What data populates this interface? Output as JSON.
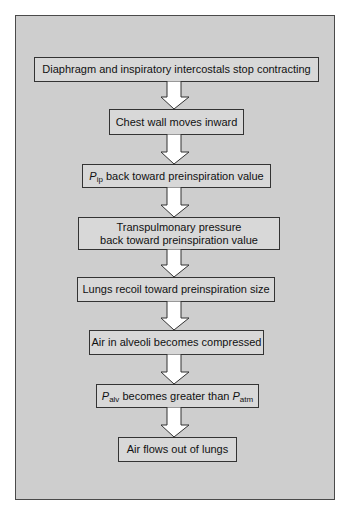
{
  "diagram": {
    "type": "flowchart",
    "direction": "top-to-bottom",
    "colors": {
      "panel_background": "#cecece",
      "box_fill": "#d8d8d8",
      "box_border": "#333333",
      "arrow_fill": "#ffffff",
      "arrow_stroke": "#333333"
    },
    "steps": [
      {
        "text": "Diaphragm and inspiratory intercostals stop contracting"
      },
      {
        "text": "Chest wall moves inward"
      },
      {
        "sym": "P",
        "sub": "ip",
        "text": " back toward preinspiration value"
      },
      {
        "line1": "Transpulmonary pressure",
        "line2": "back toward preinspiration value"
      },
      {
        "text": "Lungs recoil toward preinspiration size"
      },
      {
        "text": "Air in alveoli becomes compressed"
      },
      {
        "sym": "P",
        "sub": "alv",
        "text": " becomes greater than ",
        "sym2": "P",
        "sub2": "atm"
      },
      {
        "text": "Air flows out of lungs"
      }
    ],
    "arrows": [
      {
        "from": 0,
        "to": 1,
        "icon": "down-arrow-icon"
      },
      {
        "from": 1,
        "to": 2,
        "icon": "down-arrow-icon"
      },
      {
        "from": 2,
        "to": 3,
        "icon": "down-arrow-icon"
      },
      {
        "from": 3,
        "to": 4,
        "icon": "down-arrow-icon"
      },
      {
        "from": 4,
        "to": 5,
        "icon": "down-arrow-icon"
      },
      {
        "from": 5,
        "to": 6,
        "icon": "down-arrow-icon"
      },
      {
        "from": 6,
        "to": 7,
        "icon": "down-arrow-icon"
      }
    ]
  }
}
